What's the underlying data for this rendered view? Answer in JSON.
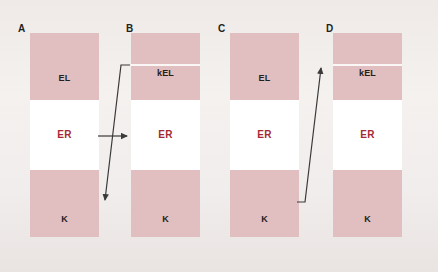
{
  "figure": {
    "background_color": "#f1edec",
    "panel_pink_color": "#e1bfc0",
    "panel_white_color": "#ffffff",
    "label_color": "#231f20",
    "er_label_color": "#a52934",
    "arrow_color": "#3a3a3a"
  },
  "panels": [
    {
      "letter": "A",
      "letter_x": 18,
      "letter_y": 24,
      "x": 30,
      "bands": [
        {
          "name": "EL",
          "label": "EL",
          "type": "pink",
          "top": 0,
          "height": 67,
          "label_offset": 24
        },
        {
          "name": "ER",
          "label": "ER",
          "type": "white",
          "top": 67,
          "height": 70,
          "label_offset": 30
        },
        {
          "name": "K",
          "label": "K",
          "type": "pink",
          "top": 137,
          "height": 67,
          "label_offset": 32
        }
      ],
      "divider": null
    },
    {
      "letter": "B",
      "letter_x": 126,
      "letter_y": 24,
      "x": 131,
      "bands": [
        {
          "name": "kEL",
          "label": "kEL",
          "type": "pink",
          "top": 0,
          "height": 67,
          "label_offset": 14
        },
        {
          "name": "ER",
          "label": "ER",
          "type": "white",
          "top": 67,
          "height": 70,
          "label_offset": 30
        },
        {
          "name": "K",
          "label": "K",
          "type": "pink",
          "top": 137,
          "height": 67,
          "label_offset": 32
        }
      ],
      "divider": 31
    },
    {
      "letter": "C",
      "letter_x": 218,
      "letter_y": 24,
      "x": 230,
      "bands": [
        {
          "name": "EL",
          "label": "EL",
          "type": "pink",
          "top": 0,
          "height": 67,
          "label_offset": 24
        },
        {
          "name": "ER",
          "label": "ER",
          "type": "white",
          "top": 67,
          "height": 70,
          "label_offset": 30
        },
        {
          "name": "K",
          "label": "K",
          "type": "pink",
          "top": 137,
          "height": 67,
          "label_offset": 32
        }
      ],
      "divider": null
    },
    {
      "letter": "D",
      "letter_x": 326,
      "letter_y": 24,
      "x": 333,
      "bands": [
        {
          "name": "kEL",
          "label": "kEL",
          "type": "pink",
          "top": 0,
          "height": 67,
          "label_offset": 14
        },
        {
          "name": "ER",
          "label": "ER",
          "type": "white",
          "top": 67,
          "height": 70,
          "label_offset": 30
        },
        {
          "name": "K",
          "label": "K",
          "type": "pink",
          "top": 137,
          "height": 67,
          "label_offset": 32
        }
      ],
      "divider": 31
    }
  ],
  "arrows": [
    {
      "name": "arrow-a-er-to-b-er",
      "from_panel": "A",
      "from_band": "ER",
      "to_panel": "B",
      "to_band": "ER",
      "points": "98,136 129,136",
      "head": "129,136"
    },
    {
      "name": "arrow-b-kel-to-a-k",
      "from_panel": "B",
      "from_band": "kEL",
      "to_panel": "A",
      "to_band": "K",
      "points": "130,65 121,65 102,201",
      "head": "102,201"
    },
    {
      "name": "arrow-c-k-to-d-kel",
      "from_panel": "C",
      "from_band": "K",
      "to_panel": "D",
      "to_band": "kEL",
      "points": "297,202 305,202 324,65",
      "head": "324,65"
    }
  ]
}
